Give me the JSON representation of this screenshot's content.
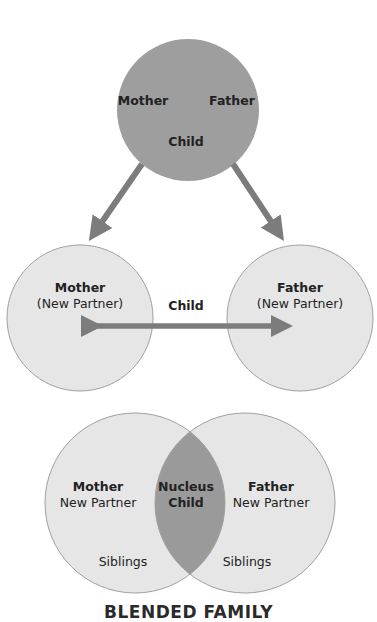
{
  "colors": {
    "nuclear_fill": "#9e9e9e",
    "light_fill": "#e6e6e6",
    "stroke": "#9a9a9a",
    "arrow": "#7c7c7c",
    "overlap_fill": "#9a9a9a",
    "text": "#222222"
  },
  "top_circle": {
    "mother": "Mother",
    "father": "Father",
    "child": "Child"
  },
  "middle": {
    "left": {
      "title": "Mother",
      "subtitle": "(New Partner)"
    },
    "right": {
      "title": "Father",
      "subtitle": "(New Partner)"
    },
    "child": "Child"
  },
  "bottom": {
    "left": {
      "title": "Mother",
      "subtitle": "New Partner",
      "siblings": "Siblings"
    },
    "right": {
      "title": "Father",
      "subtitle": "New Partner",
      "siblings": "Siblings"
    },
    "overlap": {
      "line1": "Nucleus",
      "line2": "Child"
    }
  },
  "title": "BLENDED FAMILY"
}
